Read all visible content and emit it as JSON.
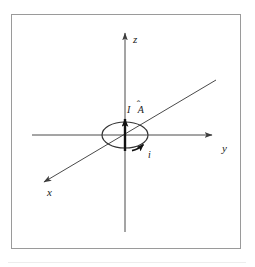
{
  "figure": {
    "background_color": "#ffffff",
    "frame_color": "#9a9a9a",
    "line_color": "#4a4a4a",
    "bold_line_color": "#111111",
    "text_color": "#1a1a1a",
    "baseline_color": "#ededed"
  },
  "axes": [
    {
      "id": "z",
      "label": "z",
      "direction": "up",
      "label_x": 133,
      "label_y": 43
    },
    {
      "id": "y",
      "label": "y",
      "direction": "right",
      "label_x": 222,
      "label_y": 152
    },
    {
      "id": "x",
      "label": "x",
      "direction": "down-left",
      "label_x": 47,
      "label_y": 196
    }
  ],
  "annotations": [
    {
      "id": "area-vector",
      "text": "I",
      "symbol": "A",
      "accent": "̂",
      "full_label": "I Â",
      "label_x": 128,
      "label_y": 113,
      "description": "current times unit area vector along z"
    },
    {
      "id": "current-direction",
      "text": "i",
      "label_x": 148,
      "label_y": 158,
      "description": "current direction arrow on the loop"
    }
  ],
  "loop": {
    "id": "current-loop",
    "center_x": 125,
    "center_y": 135,
    "radius_x": 23,
    "radius_y": 13,
    "stroke": "#333333"
  }
}
